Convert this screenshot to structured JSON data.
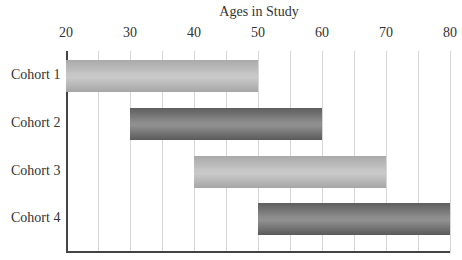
{
  "chart_data": {
    "type": "bar",
    "orientation": "horizontal-range",
    "title": "Ages in Study",
    "xlabel": "Ages in Study",
    "ylabel": "",
    "xlim": [
      20,
      80
    ],
    "x_ticks": [
      20,
      30,
      40,
      50,
      60,
      70,
      80
    ],
    "minor_gridlines_every": 5,
    "grid": true,
    "legend": null,
    "categories": [
      "Cohort 1",
      "Cohort 2",
      "Cohort 3",
      "Cohort 4"
    ],
    "series": [
      {
        "name": "Age range start",
        "values": [
          20,
          30,
          40,
          50
        ]
      },
      {
        "name": "Age range end",
        "values": [
          50,
          60,
          70,
          80
        ]
      }
    ],
    "ranges": [
      {
        "label": "Cohort 1",
        "start": 20,
        "end": 50,
        "shade": "light"
      },
      {
        "label": "Cohort 2",
        "start": 30,
        "end": 60,
        "shade": "dark"
      },
      {
        "label": "Cohort 3",
        "start": 40,
        "end": 70,
        "shade": "light"
      },
      {
        "label": "Cohort 4",
        "start": 50,
        "end": 80,
        "shade": "dark"
      }
    ],
    "colors": {
      "light": "#c4c4c4",
      "dark": "#7a7a7a",
      "grid": "#d6d6d6",
      "axis": "#444444"
    }
  },
  "labels": {
    "title": "Ages in Study",
    "ticks": [
      "20",
      "30",
      "40",
      "50",
      "60",
      "70",
      "80"
    ],
    "cohorts": [
      "Cohort 1",
      "Cohort 2",
      "Cohort 3",
      "Cohort 4"
    ]
  }
}
